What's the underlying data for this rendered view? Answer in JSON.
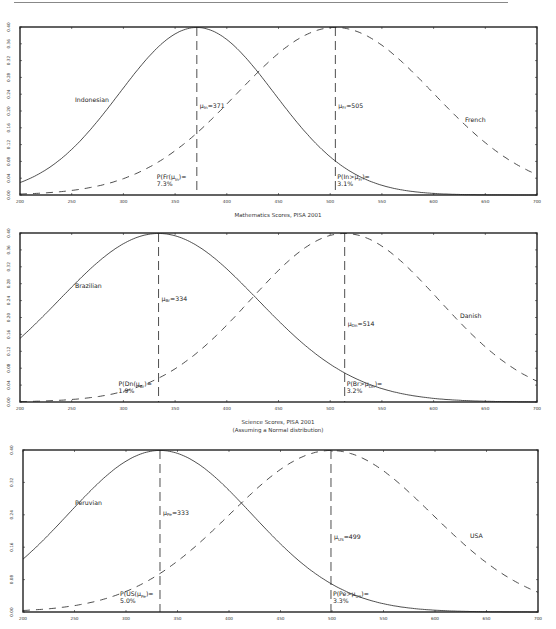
{
  "chart_data": [
    {
      "type": "line",
      "title": "",
      "xlabel": "Mathematics Scores, PISA 2001",
      "ylabel": "",
      "xlim": [
        200,
        700
      ],
      "ylim": [
        0,
        0.4
      ],
      "x_ticks": [
        200,
        250,
        300,
        350,
        400,
        450,
        500,
        550,
        600,
        650,
        700
      ],
      "y_ticks": [
        "0.00",
        "0.04",
        "0.08",
        "0.12",
        "0.16",
        "0.20",
        "0.24",
        "0.28",
        "0.32",
        "0.36",
        "0.40"
      ],
      "series": [
        {
          "name": "Indonesian",
          "style": "solid",
          "mean": 371,
          "sd": 75
        },
        {
          "name": "French",
          "style": "dashed",
          "mean": 505,
          "sd": 95
        }
      ],
      "annotations": [
        {
          "text": "μIn=371",
          "x": 371
        },
        {
          "text": "μFr=505",
          "x": 505
        },
        {
          "text": "P(Fr(μIn)=\n7.3%",
          "x": 340
        },
        {
          "text": "P(In>μFr)=\n3.1%",
          "x": 507
        }
      ]
    },
    {
      "type": "line",
      "title": "",
      "xlabel": "Science Scores, PISA 2001",
      "ylabel": "",
      "xlim": [
        200,
        700
      ],
      "ylim": [
        0,
        0.4
      ],
      "x_ticks": [
        200,
        250,
        300,
        350,
        400,
        450,
        500,
        550,
        600,
        650,
        700
      ],
      "y_ticks": [
        "0.00",
        "0.04",
        "0.08",
        "0.12",
        "0.16",
        "0.20",
        "0.24",
        "0.28",
        "0.32",
        "0.36",
        "0.40"
      ],
      "series": [
        {
          "name": "Brazilian",
          "style": "solid",
          "mean": 334,
          "sd": 96
        },
        {
          "name": "Danish",
          "style": "dashed",
          "mean": 514,
          "sd": 91
        }
      ],
      "annotations": [
        {
          "text": "μBr=334",
          "x": 334
        },
        {
          "text": "μDn=514",
          "x": 514
        },
        {
          "text": "P(Dn(μBr)=\n1.9%",
          "x": 300
        },
        {
          "text": "P(Br>μDn)=\n3.2%",
          "x": 516
        }
      ]
    },
    {
      "type": "line",
      "title": "",
      "subtitle": "(Assuming a Normal distribution)",
      "xlabel": "",
      "ylabel": "",
      "xlim": [
        200,
        700
      ],
      "ylim": [
        0,
        0.4
      ],
      "x_ticks": [
        200,
        250,
        300,
        350,
        400,
        450,
        500,
        550,
        600,
        650,
        700
      ],
      "y_ticks": [
        "0.00",
        "0.08",
        "0.16",
        "0.24",
        "0.32",
        "0.40"
      ],
      "series": [
        {
          "name": "Peruvian",
          "style": "solid",
          "mean": 333,
          "sd": 89
        },
        {
          "name": "USA",
          "style": "dashed",
          "mean": 499,
          "sd": 98
        }
      ],
      "annotations": [
        {
          "text": "μPe=333",
          "x": 333
        },
        {
          "text": "μUS=499",
          "x": 499
        },
        {
          "text": "P(US(μPe)=\n5.0%",
          "x": 300
        },
        {
          "text": "P(Pe>μUS)=\n3.3%",
          "x": 501
        }
      ]
    }
  ],
  "captions": {
    "math": "Mathematics Scores, PISA 2001",
    "science": "Science Scores, PISA 2001",
    "assumption": "(Assuming a Normal distribution)"
  },
  "charts": [
    {
      "left_label": "Indonesian",
      "right_label": "French",
      "mu_left": "=371",
      "mu_left_sub": "In",
      "mu_right": "=505",
      "mu_right_sub": "Fr",
      "p_left_1": "P(Fr(μ",
      "p_left_sub": "In",
      "p_left_2": ")=",
      "p_left_val": "7.3%",
      "p_right_1": "P(In>μ",
      "p_right_sub": "Fr",
      "p_right_2": ")=",
      "p_right_val": "3.1%"
    },
    {
      "left_label": "Brazilian",
      "right_label": "Danish",
      "mu_left": "=334",
      "mu_left_sub": "Br",
      "mu_right": "=514",
      "mu_right_sub": "Dn",
      "p_left_1": "P(Dn(μ",
      "p_left_sub": "Br",
      "p_left_2": ")=",
      "p_left_val": "1.9%",
      "p_right_1": "P(Br>μ",
      "p_right_sub": "Dn",
      "p_right_2": ")=",
      "p_right_val": "3.2%"
    },
    {
      "left_label": "Peruvian",
      "right_label": "USA",
      "mu_left": "=333",
      "mu_left_sub": "Pe",
      "mu_right": "=499",
      "mu_right_sub": "US",
      "p_left_1": "P(US(μ",
      "p_left_sub": "Pe",
      "p_left_2": ")=",
      "p_left_val": "5.0%",
      "p_right_1": "P(Pe>μ",
      "p_right_sub": "US",
      "p_right_2": ")=",
      "p_right_val": "3.3%"
    }
  ]
}
